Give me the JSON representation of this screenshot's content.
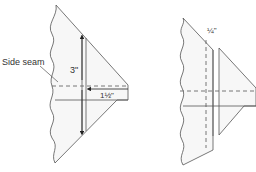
{
  "figure_left": {
    "side_seam_label": "Side seam",
    "height_label": "3\"",
    "width_label": "1½\""
  },
  "figure_right": {
    "seam_allowance_label": "¼\""
  },
  "colors": {
    "line": "#555555",
    "fill": "#f7f7f7",
    "background": "#ffffff"
  }
}
